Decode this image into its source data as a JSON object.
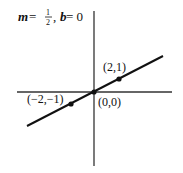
{
  "title": {
    "m_label": "m",
    "eq1": " = ",
    "frac_num": "1",
    "frac_den": "2",
    "sep": ", ",
    "b_label": "b",
    "eq2": " = 0"
  },
  "points": [
    {
      "label": "(2,1)",
      "x": 2,
      "y": 1
    },
    {
      "label": "(0,0)",
      "x": 0,
      "y": 0
    },
    {
      "label": "(−2,−1)",
      "x": -2,
      "y": -1
    }
  ],
  "line": {
    "slope": 0.5,
    "intercept": 0
  },
  "colors": {
    "ink": "#111111",
    "background": "#ffffff"
  }
}
